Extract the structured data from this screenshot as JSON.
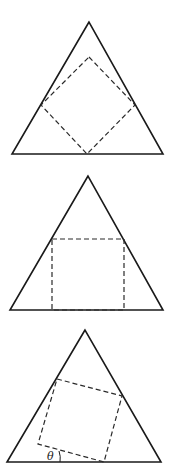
{
  "figure": {
    "panels": [
      {
        "name": "diamond-inscribed",
        "triangle": [
          [
            89,
            22
          ],
          [
            12,
            154
          ],
          [
            163,
            154
          ]
        ],
        "square": [
          [
            89,
            57
          ],
          [
            135,
            105
          ],
          [
            87,
            154
          ],
          [
            41,
            105
          ]
        ]
      },
      {
        "name": "axis-aligned-inscribed",
        "triangle": [
          [
            88,
            176
          ],
          [
            10,
            310
          ],
          [
            163,
            310
          ]
        ],
        "square": [
          [
            52,
            239
          ],
          [
            124,
            239
          ],
          [
            124,
            310
          ],
          [
            52,
            310
          ]
        ]
      },
      {
        "name": "rotated-inscribed",
        "triangle": [
          [
            85,
            330
          ],
          [
            7,
            462
          ],
          [
            161,
            462
          ]
        ],
        "square": [
          [
            57,
            379
          ],
          [
            122,
            396
          ],
          [
            104,
            462
          ],
          [
            38,
            444
          ]
        ],
        "angle_label": "θ"
      }
    ],
    "colors": {
      "stroke": "#1a1a1a",
      "background": "#ffffff"
    }
  }
}
